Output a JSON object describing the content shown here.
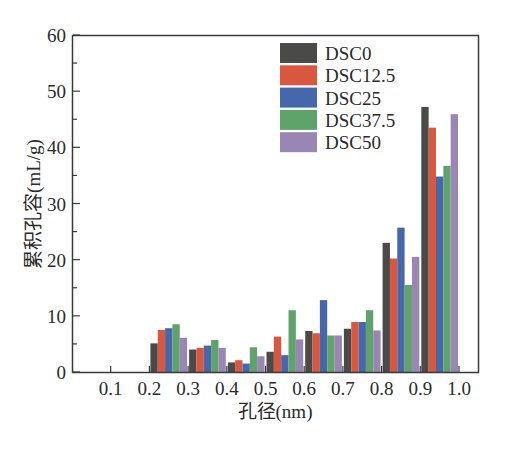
{
  "chart_data": {
    "type": "bar",
    "title": "",
    "xlabel": "孔径(nm)",
    "ylabel": "累积孔容(mL/g)",
    "ylim": [
      0,
      60
    ],
    "xlim": [
      0,
      1.0
    ],
    "yticks": [
      0,
      10,
      20,
      30,
      40,
      50,
      60
    ],
    "xticks": [
      "0.1",
      "0.2",
      "0.3",
      "0.4",
      "0.5",
      "0.6",
      "0.7",
      "0.8",
      "0.9",
      "1.0"
    ],
    "grid": false,
    "legend_position": "upper right",
    "categories": [
      "0.2-0.3",
      "0.3-0.4",
      "0.4-0.5",
      "0.5-0.6",
      "0.6-0.7",
      "0.7-0.8",
      "0.8-0.9",
      "0.9-1.0"
    ],
    "series": [
      {
        "name": "DSC0",
        "color": "#4a4a48",
        "values": [
          5.1,
          4.0,
          1.7,
          3.6,
          7.3,
          7.7,
          23.0,
          47.2
        ]
      },
      {
        "name": "DSC12.5",
        "color": "#d9573f",
        "values": [
          7.5,
          4.3,
          2.1,
          6.3,
          6.9,
          8.9,
          20.2,
          43.5
        ]
      },
      {
        "name": "DSC25",
        "color": "#4568ad",
        "values": [
          7.8,
          4.7,
          1.5,
          3.0,
          12.8,
          8.9,
          25.7,
          34.8
        ]
      },
      {
        "name": "DSC37.5",
        "color": "#5fa36a",
        "values": [
          8.5,
          5.7,
          4.4,
          11.0,
          6.5,
          11.0,
          15.5,
          36.7
        ]
      },
      {
        "name": "DSC50",
        "color": "#9a86b3",
        "values": [
          6.1,
          4.3,
          2.8,
          5.8,
          6.5,
          7.4,
          20.5,
          45.9
        ]
      }
    ],
    "bin_starts": [
      0.2,
      0.3,
      0.4,
      0.5,
      0.6,
      0.7,
      0.8,
      0.9
    ]
  }
}
